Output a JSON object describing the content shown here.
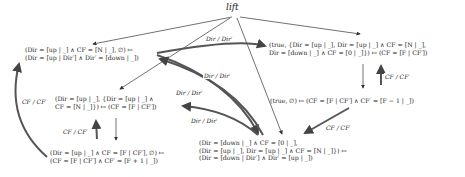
{
  "diagram": {
    "root": {
      "id": "lift",
      "label": "lift"
    },
    "nodes": [
      {
        "id": "n1",
        "lines": [
          "(Dir = [up | _] ∧ CF = [N | _], ∅) ↦",
          "(Dir = [up | Dir′] ∧ Dir′ = [down | _])"
        ]
      },
      {
        "id": "n2",
        "lines": [
          "(true, {Dir = [up | _], Dir = [up | _] ∧ CF = [N | _],",
          "Dir = [down | _] ∧ CF = [0 | _]}) ↦ (CF = [F | CF′])"
        ]
      },
      {
        "id": "n3",
        "lines": [
          "(Dir = [up | _], {Dir = [up | _] ∧",
          "CF = [N | _]}) ↦ (CF = [F | CF′])"
        ]
      },
      {
        "id": "n4",
        "lines": [
          "(true, ∅) ↦ (CF = [F | CF′] ∧ CF′ = [F − 1 | _])"
        ]
      },
      {
        "id": "n5",
        "lines": [
          "(Dir = [up | _] ∧ CF = [F | CF′], ∅) ↦",
          "(CF = [F | CF′] ∧ CF′ = [F + 1 | _])"
        ]
      },
      {
        "id": "n6",
        "lines": [
          "(Dir = [down | _] ∧ CF = [0 | _],",
          "(Dir = [up | _], Dir = [up | _] ∧ CF = [N | _]}) ↦",
          "(Dir = [down | Dir′] ∧ Dir′ = [up | _])"
        ]
      }
    ],
    "edge_labels": {
      "dir": "Dir / Dir′",
      "cf": "CF / CF′"
    },
    "edges": [
      {
        "from": "lift",
        "to": "n1",
        "label": ""
      },
      {
        "from": "lift",
        "to": "n2",
        "label": ""
      },
      {
        "from": "lift",
        "to": "n3",
        "label": ""
      },
      {
        "from": "lift",
        "to": "n6",
        "label": ""
      },
      {
        "from": "n1",
        "to": "n2",
        "label": "Dir / Dir′"
      },
      {
        "from": "n1",
        "to": "n6",
        "label": "Dir / Dir′"
      },
      {
        "from": "n6",
        "to": "n1",
        "label": "Dir / Dir′"
      },
      {
        "from": "n6",
        "to": "n3",
        "label": "Dir / Dir′"
      },
      {
        "from": "n2",
        "to": "n4",
        "label": ""
      },
      {
        "from": "n4",
        "to": "n2",
        "label": "CF / CF′"
      },
      {
        "from": "n4",
        "to": "n6",
        "label": "CF / CF′"
      },
      {
        "from": "n3",
        "to": "n5",
        "label": ""
      },
      {
        "from": "n5",
        "to": "n3",
        "label": "CF / CF′"
      },
      {
        "from": "n5",
        "to": "n1",
        "label": "CF / CF′"
      }
    ]
  }
}
